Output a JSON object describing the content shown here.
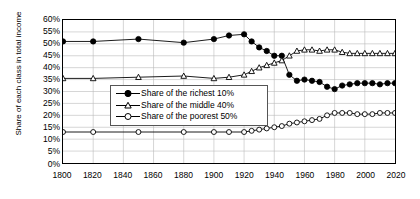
{
  "chart_data": {
    "type": "line",
    "title": "",
    "xlabel": "",
    "ylabel": "Share of each class in total income",
    "xlim": [
      1800,
      2020
    ],
    "ylim": [
      0,
      60
    ],
    "grid": true,
    "legend_position": "center-left",
    "xticks": [
      "1800",
      "1820",
      "1840",
      "1860",
      "1880",
      "1900",
      "1920",
      "1940",
      "1960",
      "1980",
      "2000",
      "2020"
    ],
    "yticks": [
      "0%",
      "5%",
      "10%",
      "15%",
      "20%",
      "25%",
      "30%",
      "35%",
      "40%",
      "45%",
      "50%",
      "55%",
      "60%"
    ],
    "series": [
      {
        "name": "Share of the richest 10%",
        "marker": "filled-circle",
        "color": "#000000",
        "x": [
          1800,
          1820,
          1850,
          1880,
          1900,
          1910,
          1920,
          1925,
          1930,
          1935,
          1940,
          1945,
          1950,
          1955,
          1960,
          1965,
          1970,
          1975,
          1980,
          1985,
          1990,
          1995,
          2000,
          2005,
          2010,
          2015,
          2020
        ],
        "values": [
          51.0,
          51.0,
          52.0,
          50.5,
          52.0,
          53.5,
          54.0,
          51.0,
          48.5,
          47.0,
          45.0,
          45.0,
          37.0,
          34.5,
          35.0,
          34.5,
          34.0,
          32.0,
          31.0,
          32.5,
          33.0,
          33.5,
          33.5,
          33.5,
          33.0,
          33.5,
          33.5
        ]
      },
      {
        "name": "Share of the middle 40%",
        "marker": "open-triangle",
        "color": "#000000",
        "x": [
          1800,
          1820,
          1850,
          1880,
          1900,
          1910,
          1920,
          1925,
          1930,
          1935,
          1940,
          1945,
          1950,
          1955,
          1960,
          1965,
          1970,
          1975,
          1980,
          1985,
          1990,
          1995,
          2000,
          2005,
          2010,
          2015,
          2020
        ],
        "values": [
          35.5,
          35.5,
          36.0,
          36.5,
          35.5,
          36.0,
          37.0,
          38.5,
          40.0,
          41.0,
          42.0,
          43.0,
          45.0,
          47.0,
          47.5,
          47.5,
          47.0,
          47.5,
          47.5,
          46.5,
          46.0,
          46.0,
          46.0,
          46.0,
          46.0,
          46.0,
          46.0
        ]
      },
      {
        "name": "Share of the poorest 50%",
        "marker": "open-circle",
        "color": "#000000",
        "x": [
          1800,
          1820,
          1850,
          1880,
          1900,
          1910,
          1920,
          1925,
          1930,
          1935,
          1940,
          1945,
          1950,
          1955,
          1960,
          1965,
          1970,
          1975,
          1980,
          1985,
          1990,
          1995,
          2000,
          2005,
          2010,
          2015,
          2020
        ],
        "values": [
          13.0,
          13.0,
          13.0,
          13.0,
          13.0,
          13.0,
          13.0,
          13.5,
          14.0,
          14.5,
          15.0,
          15.5,
          16.5,
          17.0,
          17.5,
          18.0,
          18.5,
          20.0,
          21.0,
          21.0,
          21.0,
          20.5,
          20.5,
          20.5,
          21.0,
          21.0,
          21.0
        ]
      }
    ]
  }
}
